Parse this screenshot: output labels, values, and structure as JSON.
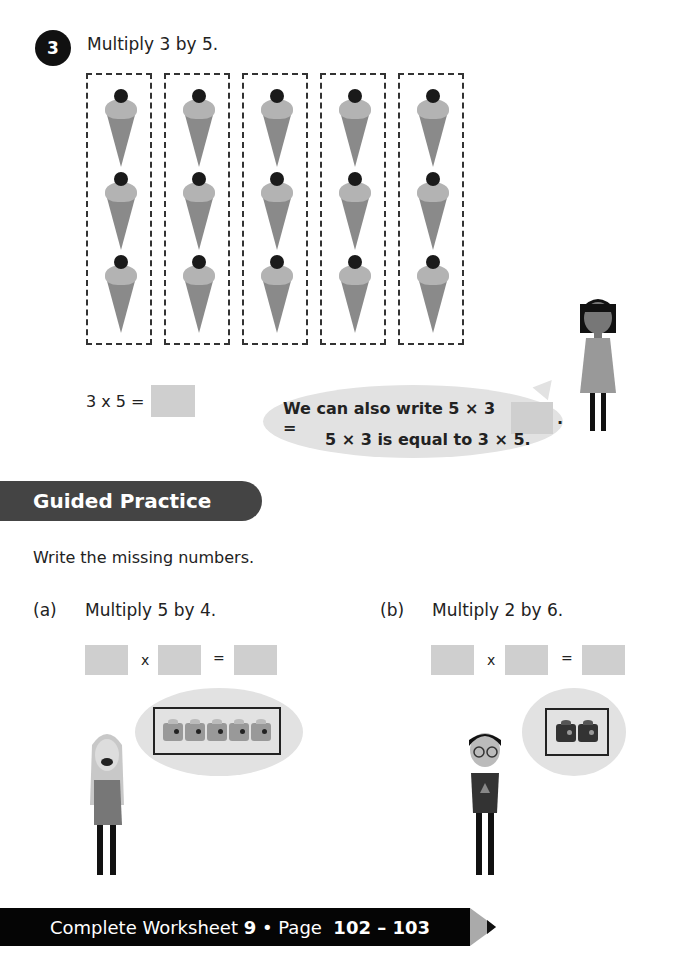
{
  "question3": {
    "number": "3",
    "prompt": "Multiply 3 by 5.",
    "groups": 5,
    "items_per_group": 3,
    "item_icon": "ice-cream-cone-icon",
    "equation_left": "3 x 5 =",
    "answer": "",
    "speech": {
      "line1": "We can also write 5 × 3 =",
      "line1_end": ".",
      "line2": "5 × 3 is equal to 3 × 5."
    }
  },
  "guided_practice": {
    "title": "Guided Practice",
    "instruction": "Write the missing numbers.",
    "parts": [
      {
        "label": "(a)",
        "prompt": "Multiply 5 by 4.",
        "times": "x",
        "equals": "=",
        "blanks": [
          "",
          "",
          ""
        ],
        "bricks": 5
      },
      {
        "label": "(b)",
        "prompt": "Multiply 2 by 6.",
        "times": "x",
        "equals": "=",
        "blanks": [
          "",
          "",
          ""
        ],
        "bricks": 2
      }
    ]
  },
  "footer": {
    "prefix": "Complete Worksheet ",
    "worksheet": "9",
    "sep": " • Page ",
    "pages": "102 – 103"
  }
}
